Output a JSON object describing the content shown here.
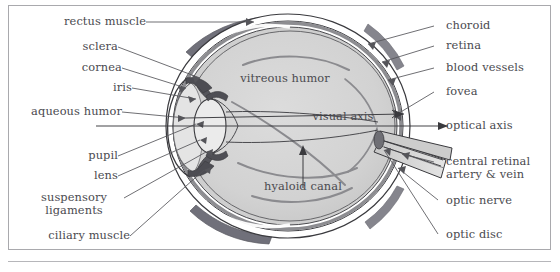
{
  "figure": {
    "frame_color": "#a9a9ad",
    "background": "#ffffff"
  },
  "colors": {
    "label_text": "#4a4a4f",
    "leader_line": "#55555a",
    "sclera_fill": "#ffffff",
    "sclera_outline": "#3c3c40",
    "choroid_fill": "#8f8f93",
    "retina_fill": "#c9c9cb",
    "vitreous_fill": "#d2d2d2",
    "aqueous_fill": "#e2e2e2",
    "lens_fill": "#e8e8e8",
    "iris_fill": "#5e5e62",
    "rectus_muscle_fill": "#787880",
    "optic_nerve_fill": "#d8d8d8",
    "blood_vessel": "#8a8a8e"
  },
  "labels_left": [
    {
      "id": "rectus-muscle",
      "text": "rectus muscle"
    },
    {
      "id": "sclera",
      "text": "sclera"
    },
    {
      "id": "cornea",
      "text": "cornea"
    },
    {
      "id": "iris",
      "text": "iris"
    },
    {
      "id": "aqueous-humor",
      "text": "aqueous humor"
    },
    {
      "id": "pupil",
      "text": "pupil"
    },
    {
      "id": "lens",
      "text": "lens"
    },
    {
      "id": "suspensory-ligaments",
      "text": "suspensory",
      "text2": "ligaments"
    },
    {
      "id": "ciliary-muscle",
      "text": "ciliary muscle"
    }
  ],
  "labels_right": [
    {
      "id": "choroid",
      "text": "choroid"
    },
    {
      "id": "retina",
      "text": "retina"
    },
    {
      "id": "blood-vessels",
      "text": "blood vessels"
    },
    {
      "id": "fovea",
      "text": "fovea"
    },
    {
      "id": "optical-axis",
      "text": "optical axis"
    },
    {
      "id": "central-retinal-artery-vein",
      "text": "central retinal",
      "text2": "artery & vein"
    },
    {
      "id": "optic-nerve",
      "text": "optic nerve"
    },
    {
      "id": "optic-disc",
      "text": "optic disc"
    }
  ],
  "labels_inside": [
    {
      "id": "vitreous-humor",
      "text": "vitreous humor"
    },
    {
      "id": "visual-axis",
      "text": "visual axis"
    },
    {
      "id": "hyaloid-canal",
      "text": "hyaloid canal"
    }
  ]
}
